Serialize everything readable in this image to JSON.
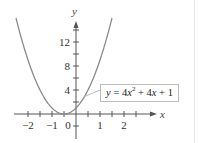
{
  "chart_data": {
    "type": "line",
    "title": "",
    "equation": "y = 4x^2 + 4x + 1",
    "equation_label": {
      "prefix": "y = 4",
      "var1": "x",
      "exp": "2",
      "mid": " + 4",
      "var2": "x",
      "suffix": " + 1"
    },
    "xlabel": "x",
    "ylabel": "y",
    "xlim": [
      -2.5,
      2.8
    ],
    "ylim": [
      -3,
      16
    ],
    "x_ticks": [
      -2,
      -1.5,
      -1,
      -0.5,
      0,
      0.5,
      1,
      1.5,
      2,
      2.5
    ],
    "x_tick_labels": [
      {
        "value": -2,
        "label": "−2"
      },
      {
        "value": -1,
        "label": "−1"
      },
      {
        "value": 0,
        "label": "0"
      },
      {
        "value": 1,
        "label": "1"
      },
      {
        "value": 2,
        "label": "2"
      }
    ],
    "y_ticks": [
      -2,
      2,
      4,
      6,
      8,
      10,
      12,
      14
    ],
    "y_tick_labels": [
      {
        "value": 4,
        "label": "4"
      },
      {
        "value": 8,
        "label": "8"
      },
      {
        "value": 12,
        "label": "12"
      }
    ],
    "grid": false,
    "legend": "none",
    "series": [
      {
        "name": "y = 4x^2 + 4x + 1",
        "color": "#8a8a8a",
        "x": [
          -2.5,
          -2,
          -1.5,
          -1,
          -0.5,
          0,
          0.5,
          1,
          1.5
        ],
        "y": [
          16,
          9,
          4,
          1,
          0,
          1,
          4,
          9,
          16
        ]
      }
    ],
    "annotation": {
      "text": "y = 4x² + 4x + 1",
      "points_to": {
        "x": 0.35,
        "y": 3
      }
    }
  },
  "colors": {
    "curve": "#8a8a8a",
    "axis": "#555555",
    "box_border": "#bdbdbd"
  }
}
